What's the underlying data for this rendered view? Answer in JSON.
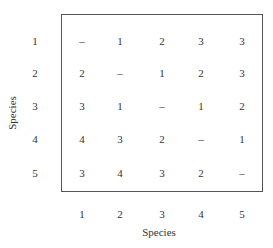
{
  "chart_data": {
    "type": "table",
    "title": "",
    "xlabel": "Species",
    "ylabel": "Species",
    "row_labels": [
      "1",
      "2",
      "3",
      "4",
      "5"
    ],
    "col_labels": [
      "1",
      "2",
      "3",
      "4",
      "5"
    ],
    "cells": [
      [
        "–",
        "1",
        "2",
        "3",
        "3"
      ],
      [
        "2",
        "–",
        "1",
        "2",
        "3"
      ],
      [
        "3",
        "1",
        "–",
        "1",
        "2"
      ],
      [
        "4",
        "3",
        "2",
        "–",
        "1"
      ],
      [
        "3",
        "4",
        "3",
        "2",
        "–"
      ]
    ]
  }
}
